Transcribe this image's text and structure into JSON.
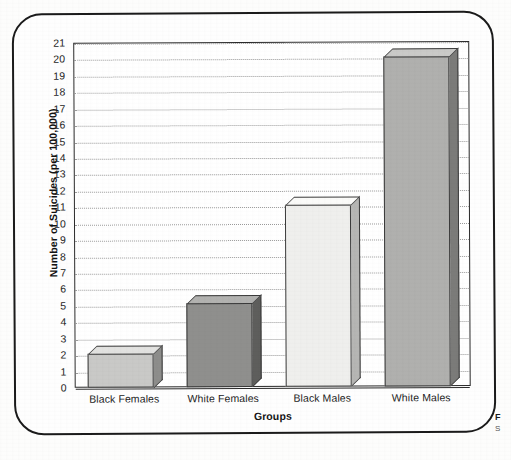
{
  "figure": {
    "frame_style": "rounded-rectangle-border",
    "caption_fragment_bold": "F",
    "caption_fragment_plain": "S"
  },
  "chart_data": {
    "type": "bar",
    "title": "",
    "subtitle": "",
    "xlabel": "Groups",
    "ylabel": "Number of Suicides (per 100,000)",
    "categories": [
      "Black Females",
      "White Females",
      "Black Males",
      "White Males"
    ],
    "values": [
      2.1,
      5.1,
      11.1,
      20.1
    ],
    "ylim": [
      0,
      21
    ],
    "ytick_step": 1,
    "yticks": [
      0,
      1,
      2,
      3,
      4,
      5,
      6,
      7,
      8,
      9,
      10,
      11,
      12,
      13,
      14,
      15,
      16,
      17,
      18,
      19,
      20,
      21
    ],
    "ytick_labels": [
      "0",
      "1",
      "2",
      "3",
      "4",
      "5",
      "6",
      "7",
      "8",
      "9",
      "10",
      "11",
      "12",
      "13",
      "14",
      "15",
      "16",
      "17",
      "18",
      "19",
      "20",
      "21"
    ],
    "grid": true,
    "grid_style": "dotted-horizontal",
    "legend": false,
    "legend_position": "none",
    "bar_style": "3d-extruded",
    "bar_colors": [
      "#c9c9c7",
      "#8f8f8d",
      "#efefed",
      "#b0b0ae"
    ],
    "bar_top_colors": [
      "#e2e2e0",
      "#b2b2b0",
      "#fbfbf9",
      "#cacac8"
    ],
    "bar_side_colors": [
      "#8d8d8b",
      "#5e5e5c",
      "#b6b6b4",
      "#7b7b79"
    ],
    "bar_edge_color": "#3a3a3a",
    "axis_color": "#2a2a2a",
    "gridline_color": "#9a9a9a",
    "plot_background": "#ffffff"
  }
}
